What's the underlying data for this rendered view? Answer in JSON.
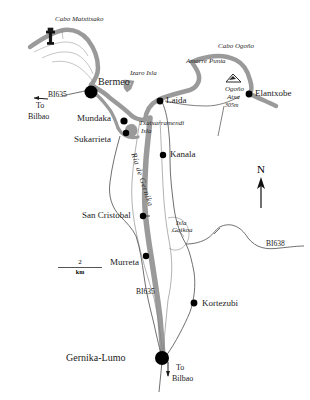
{
  "map": {
    "title": "Ria de Gernika area map",
    "colors": {
      "estuary": "#9a9a9a",
      "road_main": "#8c8c8c",
      "road_minor": "#6e6e6e",
      "marker": "#000000",
      "text": "#1a1a1a"
    },
    "places": [
      {
        "id": "bermeo",
        "label": "Bermeo",
        "x": 90,
        "y": 89,
        "size": "large"
      },
      {
        "id": "mundaka",
        "label": "Mundaka",
        "x": 112,
        "y": 122,
        "size": "medium"
      },
      {
        "id": "sukarrieta",
        "label": "Sukarrieta",
        "x": 118,
        "y": 135,
        "size": "small"
      },
      {
        "id": "laida",
        "label": "Laida",
        "x": 162,
        "y": 100,
        "size": "small"
      },
      {
        "id": "kanala",
        "label": "Kanala",
        "x": 168,
        "y": 155,
        "size": "small"
      },
      {
        "id": "elantxobe",
        "label": "Elantxobe",
        "x": 252,
        "y": 94,
        "size": "small"
      },
      {
        "id": "san-cristobal",
        "label": "San Cristobal",
        "x": 136,
        "y": 215,
        "size": "small"
      },
      {
        "id": "murreta",
        "label": "Murreta",
        "x": 141,
        "y": 259,
        "size": "small"
      },
      {
        "id": "kortezubi",
        "label": "Kortezubi",
        "x": 198,
        "y": 305,
        "size": "small"
      },
      {
        "id": "gernika-lumo",
        "label": "Gernika-Lumo",
        "x": 163,
        "y": 362,
        "size": "large"
      }
    ],
    "features": [
      {
        "id": "cabo-matxitxako",
        "label": "Cabo Matxitxako",
        "x": 55,
        "y": 20
      },
      {
        "id": "izaro-isla",
        "label": "Izaro Isla",
        "x": 131,
        "y": 73
      },
      {
        "id": "amarre-punta",
        "label": "Amarre Punta",
        "x": 190,
        "y": 63
      },
      {
        "id": "cabo-ogono",
        "label": "Cabo Ogoño",
        "x": 222,
        "y": 58
      },
      {
        "id": "txatxarramendi",
        "label": "Txatxarramendi",
        "x": 140,
        "y": 123
      },
      {
        "id": "txatxarramendi-isla",
        "label": "Isla",
        "x": 142,
        "y": 131
      },
      {
        "id": "isla-goikoa",
        "label": "Isla",
        "x": 178,
        "y": 224
      },
      {
        "id": "isla-goikoa-2",
        "label": "Goikoa",
        "x": 175,
        "y": 231
      },
      {
        "id": "ogono-atxa",
        "label": "Ogoño",
        "x": 228,
        "y": 89
      },
      {
        "id": "ogono-atxa-2",
        "label": "Atxa",
        "x": 230,
        "y": 97
      },
      {
        "id": "ogono-elev",
        "label": "305m",
        "x": 228,
        "y": 105
      }
    ],
    "roads": [
      {
        "id": "bi635-north",
        "label": "BI635",
        "x": 52,
        "y": 95
      },
      {
        "id": "bi635-south",
        "label": "BI635",
        "x": 138,
        "y": 291
      },
      {
        "id": "bi638",
        "label": "BI638",
        "x": 268,
        "y": 243
      }
    ],
    "directions": [
      {
        "id": "to-bilbao-west",
        "to": "To",
        "place": "Bilbao",
        "x": 36,
        "y": 105
      },
      {
        "id": "to-bilbao-south",
        "to": "To",
        "place": "Bilbao",
        "x": 177,
        "y": 368
      }
    ],
    "north_arrow": {
      "label": "N"
    },
    "scale_bar": {
      "value": "2",
      "unit": "km"
    }
  }
}
